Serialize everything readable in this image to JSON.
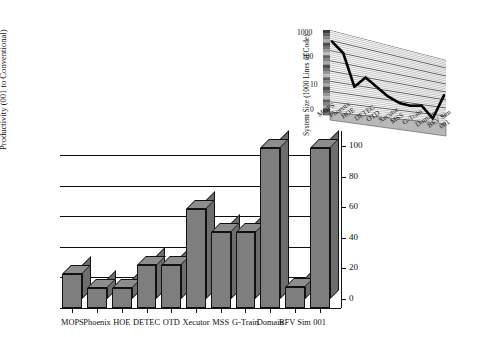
{
  "chart_data": [
    {
      "id": "main",
      "type": "bar",
      "title": "",
      "xlabel": "",
      "ylabel": "Productivity (001 to Conventional)",
      "ylim": [
        0,
        110
      ],
      "yticks": [
        0,
        20,
        40,
        60,
        80,
        100
      ],
      "grid": true,
      "legend": "none",
      "categories": [
        "MOPS",
        "Phoenix",
        "HOE",
        "DETEC",
        "OTD",
        "Xecutor",
        "MSS",
        "G-Train",
        "Domain",
        "BFV Sim",
        "001"
      ],
      "values": [
        22,
        13,
        13,
        28,
        28,
        65,
        50,
        50,
        105,
        14,
        105
      ],
      "style": "3d-bars-gray"
    },
    {
      "id": "inset",
      "type": "line",
      "title": "",
      "xlabel": "",
      "ylabel": "System Size (1000 Lines of Code)",
      "yscale": "log",
      "ylim": [
        0,
        1000
      ],
      "yticks": [
        0,
        10,
        100,
        1000
      ],
      "ytick_labels": [
        "0",
        "10",
        "100",
        "1000"
      ],
      "grid": true,
      "legend": "none",
      "categories": [
        "MOPS",
        "Phoenix",
        "HOE",
        "DETEC",
        "OTD",
        "Xecutor",
        "MSS",
        "G-Train",
        "Domain",
        "BFV Sim",
        "001"
      ],
      "values": [
        300,
        120,
        4,
        14,
        6,
        2.5,
        1.4,
        1.2,
        1.5,
        0.35,
        9
      ],
      "style": "3d-ribbon-log"
    }
  ],
  "main": {
    "ylabel": "Productivity (001 to Conventional)",
    "ytick_labels": [
      "0",
      "20",
      "40",
      "60",
      "80",
      "100"
    ],
    "categories": [
      "MOPS",
      "Phoenix",
      "HOE",
      "DETEC",
      "OTD",
      "Xecutor",
      "MSS",
      "G-Train",
      "Domain",
      "BFV Sim",
      "001"
    ]
  },
  "inset": {
    "ylabel": "System Size (1000 Lines of Code)",
    "ytick_labels": [
      "1000",
      "100",
      "10",
      "0"
    ],
    "categories": [
      "MOPS",
      "Phoenix",
      "HOE",
      "DETEC",
      "OTD",
      "Xecutor",
      "MSS",
      "G-Train",
      "Domain",
      "BFV Sim",
      "001"
    ]
  }
}
